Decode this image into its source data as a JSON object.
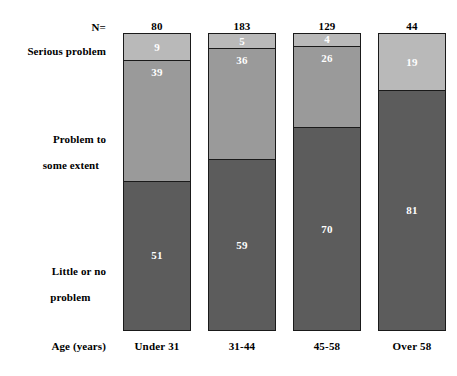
{
  "figure": {
    "row_labels": {
      "n_label": "N=",
      "serious": "Serious problem",
      "some_extent_line1": "Problem to",
      "some_extent_line2": "some extent",
      "little_line1": "Little or no",
      "little_line2": "problem",
      "age_axis": "Age (years)"
    },
    "colors": {
      "serious_problem": "#b9b9b9",
      "problem_some_extent": "#9a9a9a",
      "little_or_no_problem": "#5c5c5c",
      "bar_outline": "#1a1a1a",
      "value_text": "#ffffff",
      "background": "#ffffff"
    }
  },
  "chart_data": {
    "type": "bar",
    "subtype": "stacked-column-100percent",
    "title": "",
    "subtitle": "",
    "xlabel": "Age (years)",
    "ylabel": "",
    "ylim": [
      0,
      100
    ],
    "grid": false,
    "legend_position": "left-row-labels",
    "categories": [
      "Under 31",
      "31-44",
      "45-58",
      "Over 58"
    ],
    "sample_sizes": [
      80,
      183,
      129,
      44
    ],
    "sample_size_label": "N=",
    "stack_order_top_to_bottom": [
      "Serious problem",
      "Problem to some extent",
      "Little or no problem"
    ],
    "series": [
      {
        "name": "Serious problem",
        "values": [
          9,
          5,
          4,
          0
        ]
      },
      {
        "name": "Problem to some extent",
        "values": [
          39,
          36,
          26,
          19
        ]
      },
      {
        "name": "Little or no problem",
        "values": [
          51,
          59,
          70,
          81
        ]
      }
    ],
    "annotations": [
      "Values are percentages within each age group.",
      "For Over 58 the Serious problem segment is 0 and is not drawn."
    ]
  },
  "bars": [
    {
      "category": "Under 31",
      "n": "80",
      "segments": [
        {
          "label": "Serious problem",
          "value": "9",
          "pct": 9,
          "color": "#b9b9b9"
        },
        {
          "label": "Problem to some extent",
          "value": "39",
          "pct": 39,
          "color": "#9a9a9a"
        },
        {
          "label": "Little or no problem",
          "value": "51",
          "pct": 51,
          "color": "#5c5c5c"
        }
      ]
    },
    {
      "category": "31-44",
      "n": "183",
      "segments": [
        {
          "label": "Serious problem",
          "value": "5",
          "pct": 5,
          "color": "#b9b9b9"
        },
        {
          "label": "Problem to some extent",
          "value": "36",
          "pct": 36,
          "color": "#9a9a9a"
        },
        {
          "label": "Little or no problem",
          "value": "59",
          "pct": 59,
          "color": "#5c5c5c"
        }
      ]
    },
    {
      "category": "45-58",
      "n": "129",
      "segments": [
        {
          "label": "Serious problem",
          "value": "4",
          "pct": 4,
          "color": "#b9b9b9"
        },
        {
          "label": "Problem to some extent",
          "value": "26",
          "pct": 26,
          "color": "#9a9a9a"
        },
        {
          "label": "Little or no problem",
          "value": "70",
          "pct": 70,
          "color": "#5c5c5c"
        }
      ]
    },
    {
      "category": "Over 58",
      "n": "44",
      "segments": [
        {
          "label": "Serious problem",
          "value": "",
          "pct": 0,
          "color": "#b9b9b9"
        },
        {
          "label": "Problem to some extent",
          "value": "19",
          "pct": 19,
          "color": "#b9b9b9"
        },
        {
          "label": "Little or no problem",
          "value": "81",
          "pct": 81,
          "color": "#5c5c5c"
        }
      ]
    }
  ]
}
